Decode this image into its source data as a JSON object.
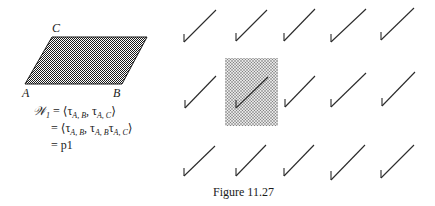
{
  "figure": {
    "caption": "Figure 11.27",
    "parallelogram": {
      "vertex_labels": {
        "A": "A",
        "B": "B",
        "C": "C"
      },
      "fill_pattern": "dense-dots",
      "fill_color": "#2a2a2a"
    },
    "equations": {
      "lhs": "𝒲",
      "lhs_sub": "1",
      "line1_rhs": "= ⟨τ",
      "line1_sub1": "A, B",
      "line1_mid": ", τ",
      "line1_sub2": "A, C",
      "line1_end": "⟩",
      "line2_start": "= ⟨τ",
      "line2_sub1": "A, B",
      "line2_mid": ", τ",
      "line2_sub2": "A, B",
      "line2_mid2": "τ",
      "line2_sub3": "A, C",
      "line2_end": "⟩",
      "line3": "= p1"
    },
    "pattern_grid": {
      "rows": 3,
      "cols": 5,
      "motif": "checkmark-shaped line",
      "highlighted_cell": {
        "row": 1,
        "col": 1
      },
      "highlight_fill": "#c8c8c8"
    }
  }
}
